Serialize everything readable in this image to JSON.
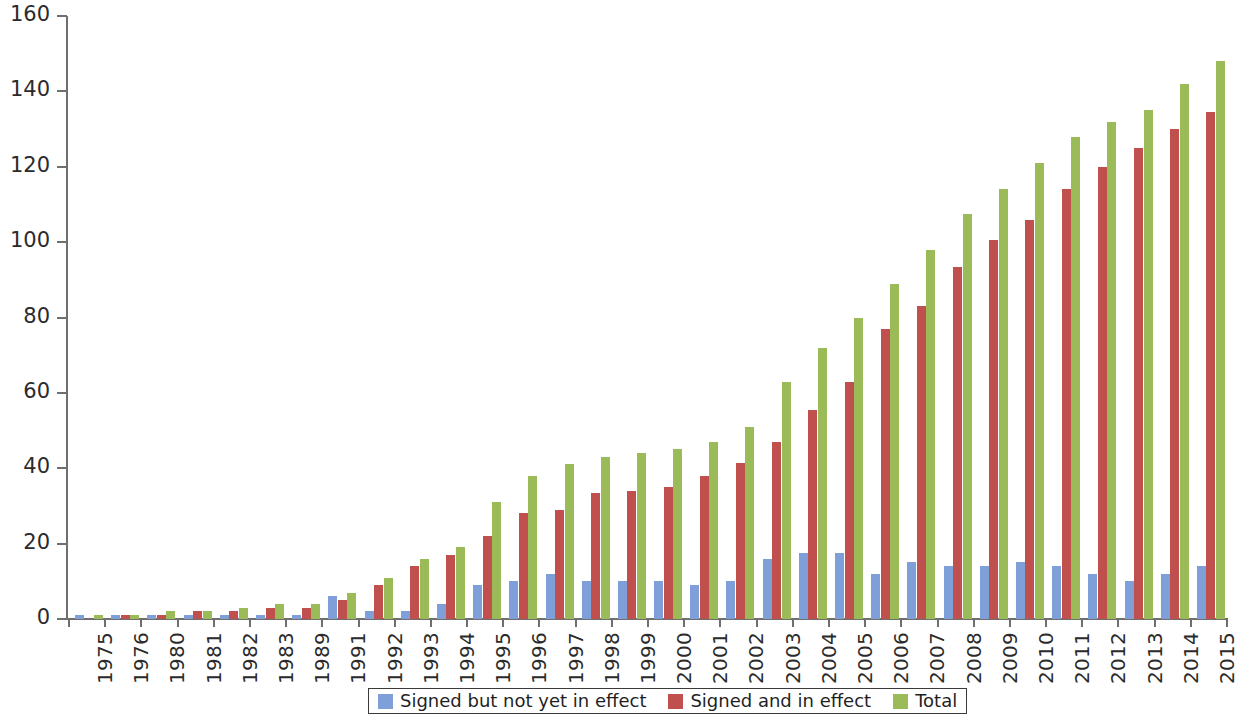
{
  "chart_data": {
    "type": "bar",
    "title": "",
    "subtitle": "",
    "xlabel": "",
    "ylabel": "",
    "ylim": [
      0,
      160
    ],
    "yticks": [
      0,
      20,
      40,
      60,
      80,
      100,
      120,
      140,
      160
    ],
    "grid": false,
    "legend_position": "bottom",
    "categories": [
      "1975",
      "1976",
      "1980",
      "1981",
      "1982",
      "1983",
      "1989",
      "1991",
      "1992",
      "1993",
      "1994",
      "1995",
      "1996",
      "1997",
      "1998",
      "1999",
      "2000",
      "2001",
      "2002",
      "2003",
      "2004",
      "2005",
      "2006",
      "2007",
      "2008",
      "2009",
      "2010",
      "2011",
      "2012",
      "2013",
      "2014",
      "2015"
    ],
    "series": [
      {
        "name": "Signed but not yet in effect",
        "color": "#7f9fd9",
        "values": [
          1,
          1,
          1,
          1,
          1,
          1,
          1,
          6,
          2,
          2,
          4,
          9,
          10,
          12,
          10,
          10,
          10,
          9,
          10,
          16,
          17.5,
          17.5,
          12,
          15,
          14,
          14,
          15,
          14,
          12,
          10,
          12,
          14
        ]
      },
      {
        "name": "Signed and in effect",
        "color": "#c0504d",
        "values": [
          0,
          1,
          1,
          2,
          2,
          3,
          3,
          5,
          9,
          14,
          17,
          22,
          28,
          29,
          33.5,
          34,
          35,
          38,
          41.5,
          47,
          55.5,
          63,
          77,
          83,
          93.5,
          100.5,
          106,
          114,
          120,
          125,
          130,
          134.5
        ]
      },
      {
        "name": "Total",
        "color": "#9bbb59",
        "values": [
          1,
          1,
          2,
          2,
          3,
          4,
          4,
          7,
          11,
          16,
          19,
          31,
          38,
          41,
          43,
          44,
          45,
          47,
          51,
          63,
          72,
          80,
          89,
          98,
          107.5,
          114,
          121,
          128,
          132,
          135,
          142,
          148
        ]
      }
    ]
  },
  "axes": {
    "y_tick_labels": [
      "0",
      "20",
      "40",
      "60",
      "80",
      "100",
      "120",
      "140",
      "160"
    ],
    "x_tick_labels": [
      "1975",
      "1976",
      "1980",
      "1981",
      "1982",
      "1983",
      "1989",
      "1991",
      "1992",
      "1993",
      "1994",
      "1995",
      "1996",
      "1997",
      "1998",
      "1999",
      "2000",
      "2001",
      "2002",
      "2003",
      "2004",
      "2005",
      "2006",
      "2007",
      "2008",
      "2009",
      "2010",
      "2011",
      "2012",
      "2013",
      "2014",
      "2015"
    ]
  },
  "legend": {
    "items": [
      {
        "label": "Signed but not yet in effect",
        "color": "#7f9fd9"
      },
      {
        "label": "Signed and in effect",
        "color": "#c0504d"
      },
      {
        "label": "Total",
        "color": "#9bbb59"
      }
    ]
  },
  "colors": {
    "series_blue": "#7f9fd9",
    "series_red": "#c0504d",
    "series_green": "#9bbb59",
    "axis": "#6f6f6f",
    "text": "#2b2b2b",
    "background": "#ffffff"
  }
}
